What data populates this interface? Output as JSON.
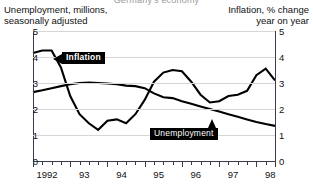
{
  "top_cut_text": "Germany's economy",
  "header": {
    "left": "Unemployment, millions,\nseasonally adjusted",
    "right": "Inflation, % change\nyear on year"
  },
  "labels": {
    "inflation": "Inflation",
    "unemployment": "Unemployment"
  },
  "axes": {
    "y_left_ticks": [
      "5",
      "4",
      "3",
      "2",
      "1",
      "0"
    ],
    "y_right_ticks": [
      "5",
      "4",
      "3",
      "2",
      "1",
      "0"
    ],
    "x_ticks": [
      "1992",
      "93",
      "94",
      "95",
      "96",
      "97",
      "98"
    ]
  },
  "colors": {
    "line": "#000000",
    "grid": "#d7d7d7",
    "axis": "#3b3b4d",
    "callout_bg": "#000000",
    "callout_fg": "#ffffff",
    "background": "#ffffff"
  },
  "chart_data": {
    "type": "line",
    "title": "",
    "xlabel": "",
    "ylabel": "Unemployment, millions, seasonally adjusted",
    "ylabel_right": "Inflation, % change year on year",
    "ylim": [
      0,
      5
    ],
    "ylim_right": [
      0,
      5
    ],
    "grid": true,
    "legend": "inline-callouts",
    "x": [
      "1992 Q1",
      "1992 Q2",
      "1992 Q3",
      "1992 Q4",
      "1993 Q1",
      "1993 Q2",
      "1993 Q3",
      "1993 Q4",
      "1994 Q1",
      "1994 Q2",
      "1994 Q3",
      "1994 Q4",
      "1995 Q1",
      "1995 Q2",
      "1995 Q3",
      "1995 Q4",
      "1996 Q1",
      "1996 Q2",
      "1996 Q3",
      "1996 Q4",
      "1997 Q1",
      "1997 Q2",
      "1997 Q3",
      "1997 Q4",
      "1998 Q1",
      "1998 Q2",
      "1998 Q3"
    ],
    "series": [
      {
        "name": "Inflation",
        "axis": "right",
        "units": "% change year on year",
        "values": [
          4.15,
          4.25,
          4.25,
          3.6,
          2.5,
          1.8,
          1.45,
          1.2,
          1.55,
          1.6,
          1.45,
          1.8,
          2.35,
          3.05,
          3.4,
          3.5,
          3.45,
          3.05,
          2.55,
          2.25,
          2.3,
          2.5,
          2.55,
          2.7,
          3.3,
          3.55,
          3.1
        ]
      },
      {
        "name": "Unemployment",
        "axis": "left",
        "units": "millions, seasonally adjusted",
        "values": [
          2.65,
          2.72,
          2.8,
          2.88,
          2.95,
          3.0,
          3.02,
          3.0,
          2.98,
          2.95,
          2.9,
          2.88,
          2.8,
          2.6,
          2.45,
          2.42,
          2.3,
          2.2,
          2.1,
          2.0,
          1.9,
          1.8,
          1.7,
          1.6,
          1.5,
          1.42,
          1.35
        ]
      }
    ]
  }
}
